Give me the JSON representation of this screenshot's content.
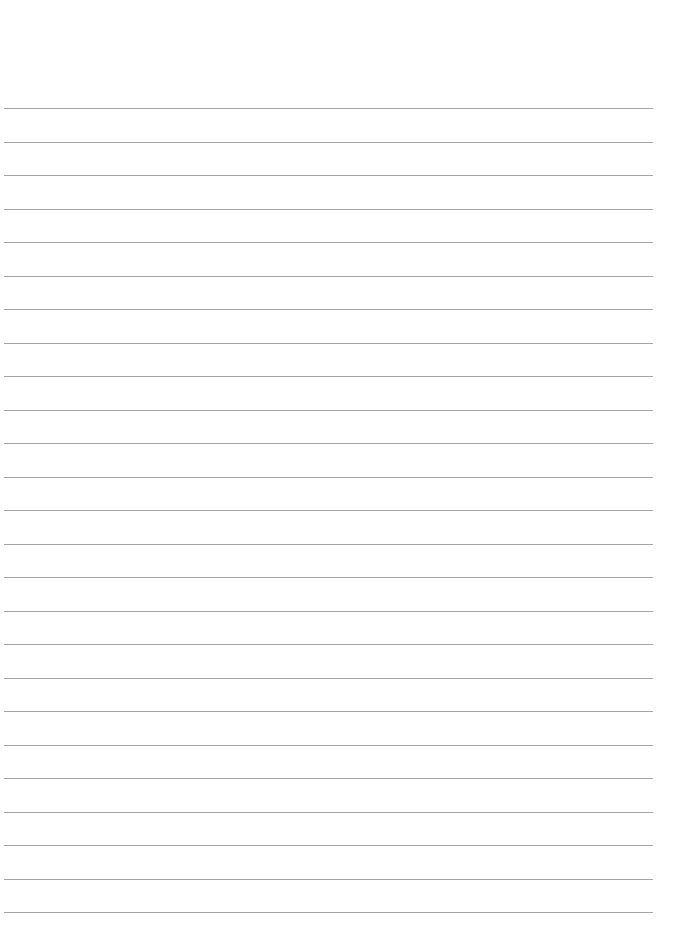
{
  "page": {
    "type": "lined-paper",
    "background_color": "#ffffff",
    "rule_color": "#9a9a9a",
    "rule_count": 25,
    "first_rule_y": 108,
    "rule_spacing": 33.5,
    "rule_left": 4,
    "rule_right": 653
  }
}
